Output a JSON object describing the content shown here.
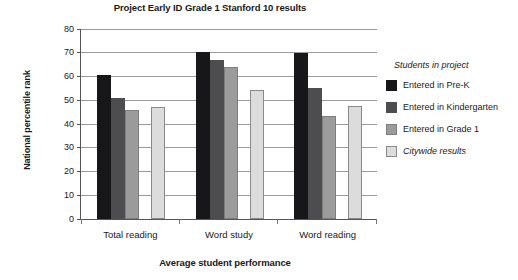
{
  "chart_data": {
    "type": "bar",
    "title": "Project Early ID Grade 1 Stanford 10 results",
    "xlabel": "Average student performance",
    "ylabel": "National percentile rank",
    "categories": [
      "Total reading",
      "Word study",
      "Word reading"
    ],
    "series": [
      {
        "name": "Entered in Pre-K",
        "color": "#17171a",
        "values": [
          60.5,
          70.5,
          70.0
        ]
      },
      {
        "name": "Entered in Kindergarten",
        "color": "#4d4d4f",
        "values": [
          51.0,
          67.0,
          55.0
        ]
      },
      {
        "name": "Entered in Grade 1",
        "color": "#9b9b9b",
        "values": [
          46.0,
          64.0,
          43.5
        ]
      },
      {
        "name": "Citywide results",
        "color": "#dcdcdc",
        "values": [
          47.0,
          54.5,
          47.5
        ]
      }
    ],
    "ylim": [
      0,
      80
    ],
    "yticks": [
      0,
      10,
      20,
      30,
      40,
      50,
      60,
      70,
      80
    ],
    "grid": true,
    "legend_position": "right"
  },
  "legend": {
    "title": "Students in project",
    "entries": [
      {
        "label": "Entered in Pre-K",
        "swatch": "series-0-swatch",
        "italic": false
      },
      {
        "label": "Entered in Kindergarten",
        "swatch": "series-1-swatch",
        "italic": false
      },
      {
        "label": "Entered in Grade 1",
        "swatch": "series-2-swatch",
        "italic": false
      },
      {
        "label": "Citywide results",
        "swatch": "series-3-swatch",
        "italic": true
      }
    ]
  }
}
